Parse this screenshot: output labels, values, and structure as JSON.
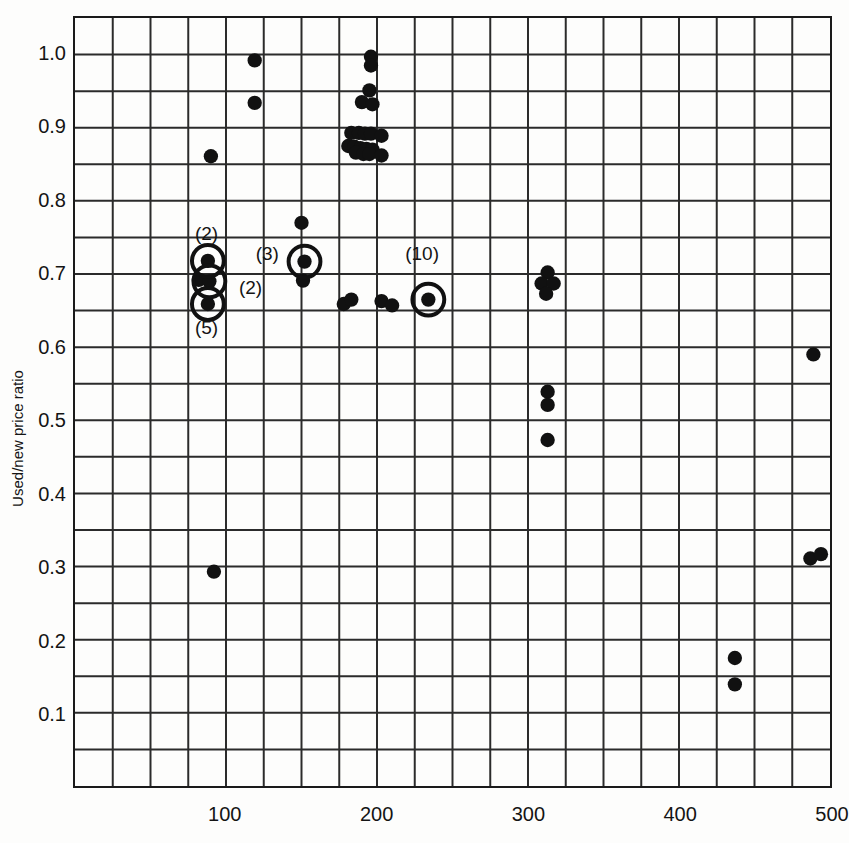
{
  "chart_data": {
    "type": "scatter",
    "title": "",
    "xlabel": "",
    "ylabel": "Used/new price ratio",
    "xlim": [
      0,
      500
    ],
    "ylim": [
      0,
      1.05
    ],
    "grid": true,
    "grid_x_step": 25,
    "grid_y_step": 0.05,
    "legend": "none",
    "xticks": [
      {
        "value": 100,
        "label": "100"
      },
      {
        "value": 200,
        "label": "200"
      },
      {
        "value": 300,
        "label": "300"
      },
      {
        "value": 400,
        "label": "400"
      },
      {
        "value": 500,
        "label": "500"
      }
    ],
    "yticks": [
      {
        "value": 1.0,
        "label": "1.0"
      },
      {
        "value": 0.9,
        "label": "0.9"
      },
      {
        "value": 0.8,
        "label": "0.8"
      },
      {
        "value": 0.7,
        "label": "0.7"
      },
      {
        "value": 0.6,
        "label": "0.6"
      },
      {
        "value": 0.5,
        "label": "0.5"
      },
      {
        "value": 0.4,
        "label": "0.4"
      },
      {
        "value": 0.3,
        "label": "0.3"
      },
      {
        "value": 0.2,
        "label": "0.2"
      },
      {
        "value": 0.1,
        "label": "0.1"
      }
    ],
    "points": [
      {
        "x": 119,
        "y": 0.992
      },
      {
        "x": 119,
        "y": 0.934
      },
      {
        "x": 90,
        "y": 0.861
      },
      {
        "x": 196,
        "y": 0.997
      },
      {
        "x": 196,
        "y": 0.985
      },
      {
        "x": 195,
        "y": 0.951
      },
      {
        "x": 190,
        "y": 0.935
      },
      {
        "x": 197,
        "y": 0.932
      },
      {
        "x": 183,
        "y": 0.893
      },
      {
        "x": 188,
        "y": 0.893
      },
      {
        "x": 192,
        "y": 0.892
      },
      {
        "x": 196,
        "y": 0.892
      },
      {
        "x": 203,
        "y": 0.889
      },
      {
        "x": 181,
        "y": 0.875
      },
      {
        "x": 185,
        "y": 0.874
      },
      {
        "x": 189,
        "y": 0.872
      },
      {
        "x": 193,
        "y": 0.871
      },
      {
        "x": 197,
        "y": 0.87
      },
      {
        "x": 186,
        "y": 0.866
      },
      {
        "x": 191,
        "y": 0.864
      },
      {
        "x": 195,
        "y": 0.864
      },
      {
        "x": 203,
        "y": 0.862
      },
      {
        "x": 150,
        "y": 0.77
      },
      {
        "x": 88,
        "y": 0.718
      },
      {
        "x": 152,
        "y": 0.717
      },
      {
        "x": 82,
        "y": 0.692
      },
      {
        "x": 89,
        "y": 0.69
      },
      {
        "x": 151,
        "y": 0.691
      },
      {
        "x": 88,
        "y": 0.659
      },
      {
        "x": 178,
        "y": 0.659
      },
      {
        "x": 183,
        "y": 0.665
      },
      {
        "x": 203,
        "y": 0.663
      },
      {
        "x": 210,
        "y": 0.657
      },
      {
        "x": 234,
        "y": 0.665
      },
      {
        "x": 313,
        "y": 0.702
      },
      {
        "x": 309,
        "y": 0.687
      },
      {
        "x": 317,
        "y": 0.687
      },
      {
        "x": 312,
        "y": 0.673
      },
      {
        "x": 489,
        "y": 0.59
      },
      {
        "x": 313,
        "y": 0.539
      },
      {
        "x": 313,
        "y": 0.521
      },
      {
        "x": 313,
        "y": 0.473
      },
      {
        "x": 487,
        "y": 0.311
      },
      {
        "x": 494,
        "y": 0.317
      },
      {
        "x": 92,
        "y": 0.293
      },
      {
        "x": 437,
        "y": 0.175
      },
      {
        "x": 437,
        "y": 0.139
      }
    ],
    "multiplicity_markers": [
      {
        "x": 88,
        "y": 0.718,
        "label": "(2)",
        "label_x": 88,
        "label_y": 0.755,
        "label_align": "above"
      },
      {
        "x": 89,
        "y": 0.69,
        "label": "(2)",
        "label_x": 117,
        "label_y": 0.681,
        "label_align": "right"
      },
      {
        "x": 88,
        "y": 0.659,
        "label": "(5)",
        "label_x": 88,
        "label_y": 0.627,
        "label_align": "below"
      },
      {
        "x": 152,
        "y": 0.717,
        "label": "(3)",
        "label_x": 128,
        "label_y": 0.727,
        "label_align": "left"
      },
      {
        "x": 234,
        "y": 0.665,
        "label": "(10)",
        "label_x": 230,
        "label_y": 0.727,
        "label_align": "above"
      }
    ],
    "colors": {
      "point": "#111111",
      "axis": "#1a1a1a",
      "grid": "#2b2b2b",
      "background": "#fdfdfc",
      "text": "#141414"
    }
  }
}
